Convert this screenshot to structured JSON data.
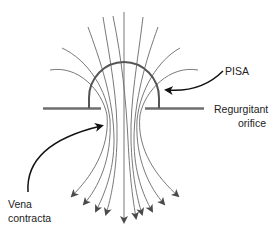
{
  "diagram": {
    "labels": {
      "pisa": "PISA",
      "orifice_line1": "Regurgitant",
      "orifice_line2": "orifice",
      "vena_line1": "Vena",
      "vena_line2": "contracta"
    },
    "colors": {
      "stream": "#6a6a6a",
      "plate": "#6e6e6e",
      "pisa": "#555555",
      "callout": "#111111",
      "arrowhead": "#4a4a4a",
      "text": "#222222"
    },
    "elements": [
      "flow-streamlines",
      "orifice-plate-left",
      "orifice-plate-right",
      "pisa-hemisphere",
      "pisa-callout-arrow",
      "vena-contracta-callout-arrow"
    ]
  }
}
